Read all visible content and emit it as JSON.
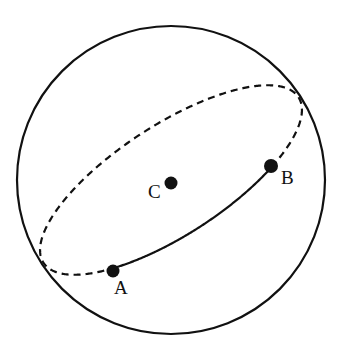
{
  "figure": {
    "background_color": "#ffffff",
    "stroke_color": "#111111"
  },
  "sphere": {
    "name": "sphere-outline",
    "center_x": 171,
    "center_y": 180,
    "radius": 154,
    "stroke_width": 2.2,
    "style": "solid"
  },
  "great_circle": {
    "name": "great-circle-ellipse",
    "center_x": 171,
    "center_y": 180,
    "semi_major": 152,
    "semi_minor": 55,
    "rotation_deg": -33,
    "front_arc_style": "solid",
    "back_arc_style": "dashed",
    "dash_pattern": "7,5",
    "stroke_width": 2.2
  },
  "points": [
    {
      "id": "A",
      "label": "A",
      "x": 113,
      "y": 271,
      "dot_radius": 6.5,
      "label_x": 114,
      "label_y": 278
    },
    {
      "id": "B",
      "label": "B",
      "x": 271,
      "y": 166,
      "dot_radius": 7,
      "label_x": 281,
      "label_y": 168
    },
    {
      "id": "C",
      "label": "C",
      "x": 171,
      "y": 183,
      "dot_radius": 6.5,
      "label_x": 148,
      "label_y": 182
    }
  ],
  "chart_data": {
    "type": "scatter",
    "xlabel": "",
    "ylabel": "",
    "series": [
      {
        "name": "labelled-points",
        "points": [
          {
            "label": "A",
            "x": 113,
            "y": 271
          },
          {
            "label": "B",
            "x": 271,
            "y": 166
          },
          {
            "label": "C",
            "x": 171,
            "y": 183
          }
        ]
      }
    ],
    "annotations": [
      "Outer solid circle is the sphere silhouette",
      "Solid elliptical arc from A to B is the near (front) half of the great circle",
      "Dashed elliptical arc is the far (hidden) half of the great circle",
      "C marks the centre of the sphere"
    ],
    "grid": false,
    "legend": "none"
  }
}
